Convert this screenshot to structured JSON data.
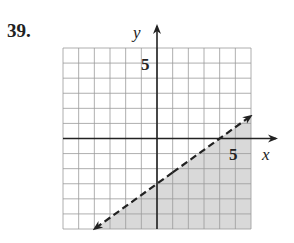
{
  "problem_number": "39.",
  "chart_data": {
    "type": "line",
    "title": "",
    "xlabel": "x",
    "ylabel": "y",
    "xlim": [
      -6,
      6
    ],
    "ylim": [
      -6,
      6
    ],
    "grid": true,
    "tick_labels": {
      "x": [
        "5"
      ],
      "y": [
        "5"
      ]
    },
    "series": [
      {
        "name": "boundary line y = (3/4)x - 3",
        "style": "dashed",
        "slope": 0.75,
        "intercept": -3,
        "x": [
          -4,
          6
        ],
        "y": [
          -6,
          1.5
        ],
        "arrows": "both"
      }
    ],
    "shaded_region": "below line (y < (3/4)x - 3)",
    "colors": {
      "shade": "#d9d9d9",
      "grid": "#9a9a9a",
      "axis": "#222222"
    }
  },
  "labels": {
    "x_axis": "x",
    "y_axis": "y",
    "x_tick": "5",
    "y_tick": "5"
  }
}
